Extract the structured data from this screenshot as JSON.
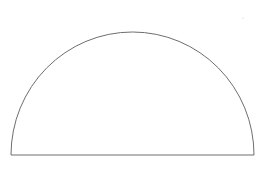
{
  "canvas": {
    "width": 268,
    "height": 169,
    "background_color": "#ffffff",
    "title": "Semicircle outline"
  },
  "figure": {
    "name": "half-ellipse-outline",
    "stroke_color": "#6e6e6e",
    "fill_color": "#ffffff",
    "stroke_width": 1,
    "geometry": {
      "center_x": 132.5,
      "baseline_y": 155,
      "radius_x": 121.5,
      "radius_y": 123,
      "apex_x": 132.5,
      "apex_y": 32,
      "base_left_x": 11,
      "base_right_x": 254
    },
    "path": "M 11 155 A 121.5 123 0 0 1 254 155 Z"
  },
  "artifacts": {
    "speck": {
      "name": "faint-speck",
      "x": 243,
      "y": 18,
      "radius": 1.2,
      "color": "#f2f2f2"
    }
  }
}
